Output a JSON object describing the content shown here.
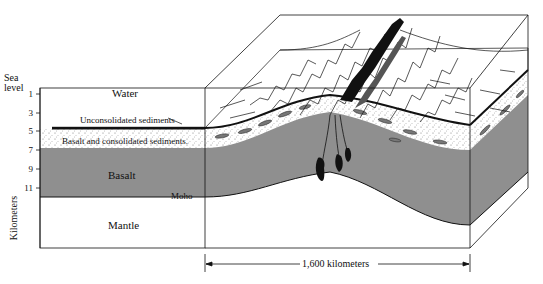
{
  "axis": {
    "top_label_line1": "Sea",
    "top_label_line2": "level",
    "ticks": [
      "1",
      "3",
      "5",
      "7",
      "9",
      "11"
    ],
    "unit_label": "Kilometers"
  },
  "layers": {
    "water": "Water",
    "unconsolidated": "Unconsolidated sediments",
    "consolidated": "Basalt and consolidated sediments.",
    "basalt": "Basalt",
    "moho": "Moho",
    "mantle": "Mantle"
  },
  "scale": {
    "label": "1,600 kilometers"
  },
  "colors": {
    "basalt_gray": "#8f8f8f",
    "line": "#111111",
    "background": "#ffffff"
  }
}
